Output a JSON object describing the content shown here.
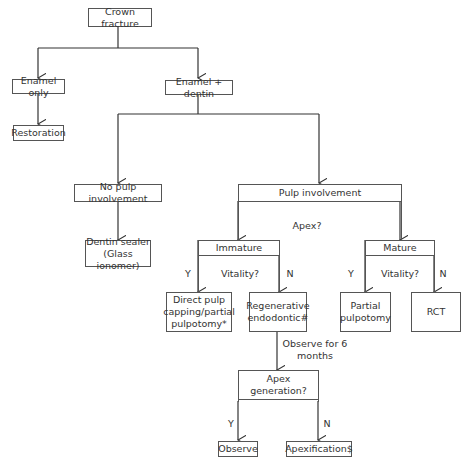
{
  "nodes": {
    "crown_fracture": "Crown fracture",
    "enamel_only": "Enamel only",
    "restoration": "Restoration",
    "enamel_dentin": "Enamel + dentin",
    "no_pulp": "No pulp involvement",
    "dentin_sealer": "Dentin sealer\n(Glass ionomer)",
    "pulp_involvement": "Pulp involvement",
    "immature": "Immature",
    "mature": "Mature",
    "direct_pulp": "Direct pulp\ncapping/partial\npulpotomy*",
    "regenerative": "Regenerative\nendodontic#",
    "partial_pulpotomy": "Partial\npulpotomy",
    "rct": "RCT",
    "apex_generation": "Apex\ngeneration?",
    "observe": "Observe",
    "apexification": "Apexification$"
  },
  "labels": {
    "apex_q": "Apex?",
    "vitality_left": "Vitality?",
    "vitality_right": "Vitality?",
    "yes": "Y",
    "no": "N",
    "observe_6": "Observe for 6\nmonths"
  }
}
